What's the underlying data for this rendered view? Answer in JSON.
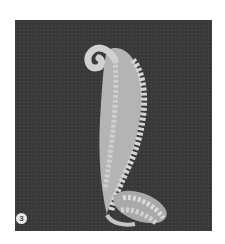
{
  "image": {
    "subject": "diamond-set scroll leaf brooch photograph",
    "background_color": "#3b3b3b",
    "page_color": "#ffffff",
    "metal_color": "#c8c8c8",
    "leaf_color": "#b4b4b4"
  },
  "figure": {
    "number": "3"
  }
}
